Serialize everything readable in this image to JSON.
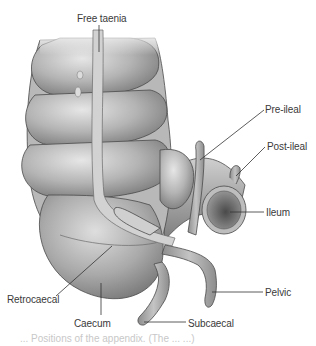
{
  "diagram": {
    "labels": {
      "free_taenia": "Free taenia",
      "pre_ileal": "Pre-ileal",
      "post_ileal": "Post-ileal",
      "ileum": "Ileum",
      "pelvic": "Pelvic",
      "retrocaecal": "Retrocaecal",
      "caecum": "Caecum",
      "subcaecal": "Subcaecal"
    },
    "caption_partial": "... Positions of the appendix. (The ... ...)",
    "colors": {
      "background": "#ffffff",
      "tissue_light": "#d9d9d9",
      "tissue_mid": "#a8a8a8",
      "tissue_dark": "#6e6e6e",
      "outline": "#4a4a4a",
      "label_text": "#3a3a3a",
      "leader_line": "#333333"
    }
  }
}
